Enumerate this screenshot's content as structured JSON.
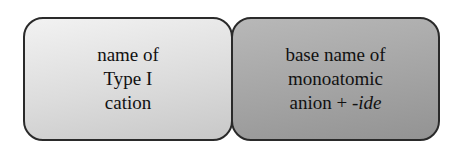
{
  "diagram": {
    "boxes": [
      {
        "lines": [
          "name of",
          "Type I",
          "cation"
        ]
      },
      {
        "lines": [
          "base name of",
          "monoatomic"
        ],
        "last_line_prefix": "anion + ",
        "last_line_suffix_italic": "-ide"
      }
    ]
  }
}
